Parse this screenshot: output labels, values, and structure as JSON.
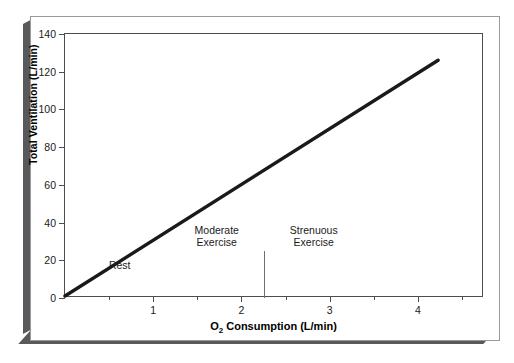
{
  "chart_data": {
    "type": "line",
    "title": "",
    "xlabel": "O2 Consumption (L/min)",
    "xlabel_base": "O",
    "xlabel_sub": "2",
    "xlabel_rest": " Consumption (L/min)",
    "ylabel": "Total Ventilation (L/min)",
    "xlim": [
      0,
      4.75
    ],
    "ylim": [
      0,
      140
    ],
    "grid": false,
    "legend": "none",
    "line_color": "#1a1a1a",
    "axis_color": "#4d4d4d",
    "background": "#ffffff",
    "x_ticks_major": [
      1,
      2,
      3,
      4
    ],
    "x_tick_labels": [
      "1",
      "2",
      "3",
      "4"
    ],
    "x_ticks_minor": [
      0.5,
      1.5,
      2.5,
      3.5,
      4.5
    ],
    "y_ticks": [
      0,
      20,
      40,
      60,
      80,
      100,
      120,
      140
    ],
    "y_tick_labels": [
      "0",
      "20",
      "40",
      "60",
      "80",
      "100",
      "120",
      "140"
    ],
    "series": [
      {
        "name": "Total ventilation vs O2 consumption",
        "x": [
          0,
          4.25
        ],
        "y": [
          0,
          126
        ]
      }
    ],
    "annotations": [
      {
        "text": "Rest",
        "x": 0.62,
        "y": 14,
        "lines": [
          "Rest"
        ]
      },
      {
        "text": "Moderate Exercise",
        "x": 1.72,
        "y": 26,
        "lines": [
          "Moderate",
          "Exercise"
        ]
      },
      {
        "text": "Strenuous Exercise",
        "x": 2.82,
        "y": 26,
        "lines": [
          "Strenuous",
          "Exercise"
        ]
      }
    ],
    "dividers": [
      {
        "x": 2.26,
        "y_from": 0,
        "y_to": 25
      }
    ]
  }
}
